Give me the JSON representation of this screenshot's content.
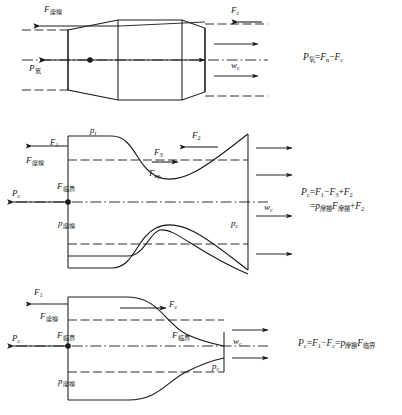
{
  "figure": {
    "title": "",
    "panels": [
      {
        "id": "panel-1",
        "labels": {
          "f_friction_top": "F",
          "f_friction_top_sub": "摩擦",
          "f_c_top": "F",
          "f_c_top_sub": "c",
          "p_oxygen": "P",
          "p_oxygen_sub": "氧",
          "w_c": "w",
          "w_c_sub": "c"
        },
        "equation": {
          "line1": "P氧 = Fн − Fс",
          "parts": [
            {
              "base": "P",
              "sub": "氧"
            },
            {
              "op": "="
            },
            {
              "base": "F",
              "sub": "n"
            },
            {
              "op": "−"
            },
            {
              "base": "F",
              "sub": "c"
            }
          ]
        }
      },
      {
        "id": "panel-2",
        "labels": {
          "f1": "F",
          "f1_sub": "1",
          "f_friction_upper": "F",
          "f_friction_upper_sub": "摩擦",
          "p_c_left": "P",
          "p_c_left_sub": "c",
          "f_critical": "F",
          "f_critical_sub": "临界",
          "p_r": "p",
          "p_r_sub": "r",
          "f3": "F",
          "f3_sub": "3",
          "f2": "F",
          "f2_sub": "2",
          "f_kp": "F",
          "f_kp_sub": "кр",
          "p_friction": "p",
          "p_friction_sub": "摩擦",
          "p_c_right": "p",
          "p_c_right_sub": "c",
          "w_c": "w",
          "w_c_sub": "c"
        },
        "equation": {
          "line1_parts": [
            {
              "base": "P",
              "sub": "c"
            },
            {
              "op": "="
            },
            {
              "base": "F",
              "sub": "1"
            },
            {
              "op": "−"
            },
            {
              "base": "F",
              "sub": "3"
            },
            {
              "op": "+"
            },
            {
              "base": "F",
              "sub": "2"
            }
          ],
          "line2_parts": [
            {
              "op": "="
            },
            {
              "base": "p",
              "sub": "摩擦"
            },
            {
              "base": "F",
              "sub": "摩擦"
            },
            {
              "op": "+"
            },
            {
              "base": "F",
              "sub": "2"
            }
          ]
        }
      },
      {
        "id": "panel-3",
        "labels": {
          "f1": "F",
          "f1_sub": "1",
          "f_friction_upper": "F",
          "f_friction_upper_sub": "摩擦",
          "f_c": "F",
          "f_c_sub": "c",
          "p_c_left": "P",
          "p_c_left_sub": "c",
          "f_critical_left": "F",
          "f_critical_left_sub": "临界",
          "f_critical_right": "F",
          "f_critical_right_sub": "临界",
          "w_c": "w",
          "w_c_sub": "c",
          "p_c_right": "p",
          "p_c_right_sub": "c",
          "p_friction": "p",
          "p_friction_sub": "摩擦"
        },
        "equation": {
          "parts": [
            {
              "base": "P",
              "sub": "c"
            },
            {
              "op": "="
            },
            {
              "base": "F",
              "sub": "1"
            },
            {
              "op": "−"
            },
            {
              "base": "F",
              "sub": "c"
            },
            {
              "op": "="
            },
            {
              "base": "p",
              "sub": "摩擦"
            },
            {
              "base": "F",
              "sub": "临界"
            }
          ]
        }
      }
    ],
    "colors": {
      "line": "#1a1a1a",
      "background": "#ffffff"
    }
  }
}
